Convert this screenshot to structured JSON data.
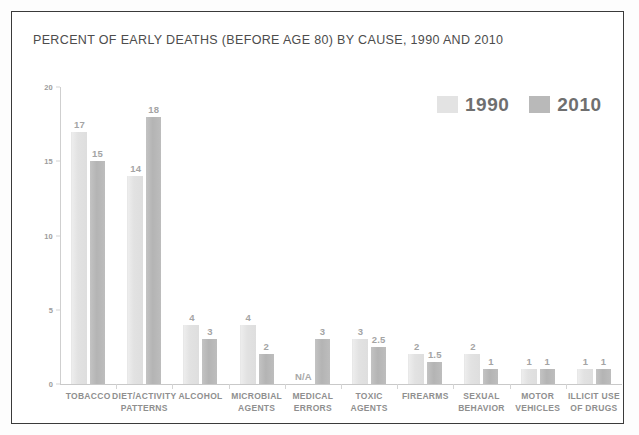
{
  "figure": {
    "title": "PERCENT OF EARLY DEATHS (BEFORE AGE 80) BY CAUSE, 1990 AND 2010",
    "border_color": "#3a3a3a",
    "background": "#ffffff"
  },
  "legend": {
    "position": "top-right",
    "entries": [
      {
        "label": "1990",
        "color": "#e3e3e3"
      },
      {
        "label": "2010",
        "color": "#b9b9b9"
      }
    ]
  },
  "chart_data": {
    "type": "bar",
    "title": "PERCENT OF EARLY DEATHS (BEFORE AGE 80) BY CAUSE, 1990 AND 2010",
    "xlabel": "",
    "ylabel": "",
    "ylim": [
      0,
      20
    ],
    "yticks": [
      0,
      5,
      10,
      15,
      20
    ],
    "ytick_labels": [
      "0",
      "5",
      "10",
      "15",
      "20"
    ],
    "grid": false,
    "legend_position": "upper right",
    "categories": [
      "TOBACCO",
      "DIET/ACTIVITY\nPATTERNS",
      "ALCOHOL",
      "MICROBIAL\nAGENTS",
      "MEDICAL\nERRORS",
      "TOXIC\nAGENTS",
      "FIREARMS",
      "SEXUAL\nBEHAVIOR",
      "MOTOR\nVEHICLES",
      "ILLICIT USE\nOF DRUGS"
    ],
    "series": [
      {
        "name": "1990",
        "color": "#e3e3e3",
        "values": [
          17,
          14,
          4,
          4,
          null,
          3,
          2,
          2,
          1,
          1
        ],
        "value_labels": [
          "17",
          "14",
          "4",
          "4",
          "N/A",
          "3",
          "2",
          "2",
          "1",
          "1"
        ]
      },
      {
        "name": "2010",
        "color": "#b9b9b9",
        "values": [
          15,
          18,
          3,
          2,
          3,
          2.5,
          1.5,
          1,
          1,
          1
        ],
        "value_labels": [
          "15",
          "18",
          "3",
          "2",
          "3",
          "2.5",
          "1.5",
          "1",
          "1",
          "1"
        ]
      }
    ]
  }
}
